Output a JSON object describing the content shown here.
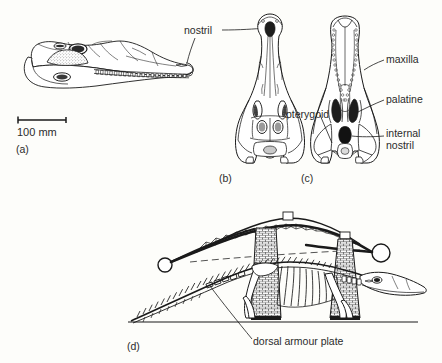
{
  "figure": {
    "background_color": "#fdfdfa",
    "ink_color": "#1a1a1a",
    "panels": [
      {
        "id": "a",
        "label": "(a)",
        "view": "lateral skull"
      },
      {
        "id": "b",
        "label": "(b)",
        "view": "dorsal skull"
      },
      {
        "id": "c",
        "label": "(c)",
        "view": "ventral skull / palate"
      },
      {
        "id": "d",
        "label": "(d)",
        "view": "skeleton and bridge analogy"
      }
    ],
    "scale_bar": {
      "label": "100 mm",
      "units": "mm",
      "value": 100
    },
    "annotations": [
      {
        "name": "nostril",
        "text": "nostril",
        "panels": [
          "a",
          "b"
        ]
      },
      {
        "name": "maxilla",
        "text": "maxilla",
        "panels": [
          "c"
        ]
      },
      {
        "name": "palatine",
        "text": "palatine",
        "panels": [
          "c"
        ]
      },
      {
        "name": "pterygoid",
        "text": "pterygoid",
        "panels": [
          "c"
        ]
      },
      {
        "name": "internal-nostril",
        "text": "internal",
        "text2": "nostril",
        "panels": [
          "c"
        ]
      },
      {
        "name": "dorsal-armour-plate",
        "text": "dorsal armour plate",
        "panels": [
          "d"
        ]
      }
    ]
  }
}
